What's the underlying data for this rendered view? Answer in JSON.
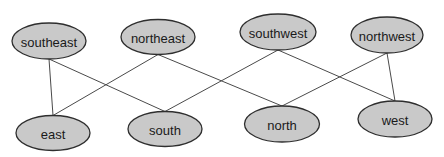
{
  "diagram": {
    "type": "bipartite-graph",
    "top_row": [
      "southeast",
      "northeast",
      "southwest",
      "northwest"
    ],
    "bottom_row": [
      "east",
      "south",
      "north",
      "west"
    ],
    "nodes": [
      {
        "id": "southeast",
        "label": "southeast"
      },
      {
        "id": "northeast",
        "label": "northeast"
      },
      {
        "id": "southwest",
        "label": "southwest"
      },
      {
        "id": "northwest",
        "label": "northwest"
      },
      {
        "id": "east",
        "label": "east"
      },
      {
        "id": "south",
        "label": "south"
      },
      {
        "id": "north",
        "label": "north"
      },
      {
        "id": "west",
        "label": "west"
      }
    ],
    "edges": [
      {
        "from": "southeast",
        "to": "east"
      },
      {
        "from": "southeast",
        "to": "south"
      },
      {
        "from": "northeast",
        "to": "east"
      },
      {
        "from": "northeast",
        "to": "north"
      },
      {
        "from": "southwest",
        "to": "south"
      },
      {
        "from": "southwest",
        "to": "west"
      },
      {
        "from": "northwest",
        "to": "north"
      },
      {
        "from": "northwest",
        "to": "west"
      }
    ],
    "colors": {
      "node_fill": "#c9c9c9",
      "node_stroke": "#2e2e2e",
      "edge": "#4a4a4a"
    }
  }
}
